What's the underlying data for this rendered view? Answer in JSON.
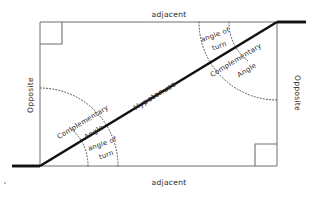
{
  "figure": {
    "background_color": "#ffffff",
    "line_color": "#111111",
    "rect_color": "#6f6f6f",
    "arc_color": "#4a4a4a",
    "text_color": "#2b2b2b"
  },
  "labels": {
    "adjacent_top": "adjacent",
    "adjacent_bottom": "adjacent",
    "opposite_left": "Opposite",
    "opposite_right": "Opposite",
    "hypotenuse": "Hypotenuse",
    "complementary_angle_lower_line1": "Complementary",
    "complementary_angle_lower_line2": "Angle",
    "angle_of_turn_lower_line1": "angle of",
    "angle_of_turn_lower_line2": "turn",
    "complementary_angle_upper_line1": "Complementary",
    "complementary_angle_upper_line2": "Angle",
    "angle_of_turn_upper_line1": "angle of",
    "angle_of_turn_upper_line2": "turn"
  },
  "geometry": {
    "rect_left": 40,
    "rect_top": 22,
    "rect_right": 277,
    "rect_bottom": 166,
    "hypotenuse_from": "bottom-left",
    "hypotenuse_to": "top-right",
    "right_angle_markers": [
      "top-left",
      "bottom-right"
    ],
    "ray_left_end_x": 12,
    "ray_right_end_x": 306,
    "arc_large_radius": 78,
    "arc_small_radius": 48
  }
}
